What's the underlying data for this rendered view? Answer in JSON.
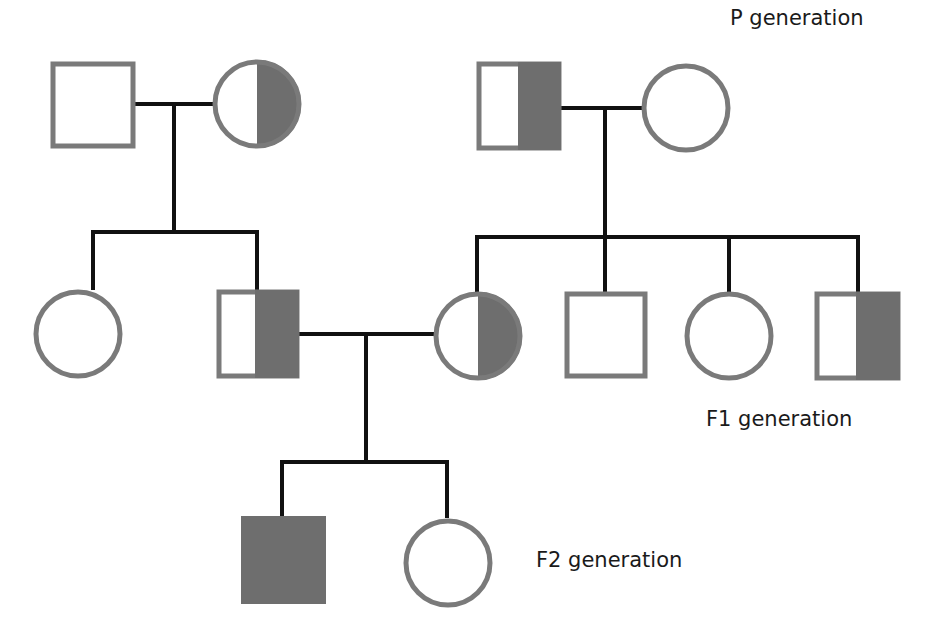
{
  "diagram": {
    "type": "pedigree",
    "colors": {
      "outline": "#7a7a7a",
      "fill": "#6e6e6e",
      "line": "#111111",
      "background": "#ffffff"
    },
    "labels": {
      "p": "P generation",
      "f1": "F1 generation",
      "f2": "F2 generation"
    },
    "individuals": [
      {
        "id": "P1",
        "generation": "P",
        "sex": "male",
        "status": "unaffected"
      },
      {
        "id": "P2",
        "generation": "P",
        "sex": "female",
        "status": "carrier"
      },
      {
        "id": "P3",
        "generation": "P",
        "sex": "male",
        "status": "carrier"
      },
      {
        "id": "P4",
        "generation": "P",
        "sex": "female",
        "status": "unaffected"
      },
      {
        "id": "F1-1",
        "generation": "F1",
        "sex": "female",
        "status": "unaffected"
      },
      {
        "id": "F1-2",
        "generation": "F1",
        "sex": "male",
        "status": "carrier"
      },
      {
        "id": "F1-3",
        "generation": "F1",
        "sex": "female",
        "status": "carrier"
      },
      {
        "id": "F1-4",
        "generation": "F1",
        "sex": "male",
        "status": "unaffected"
      },
      {
        "id": "F1-5",
        "generation": "F1",
        "sex": "female",
        "status": "unaffected"
      },
      {
        "id": "F1-6",
        "generation": "F1",
        "sex": "male",
        "status": "carrier"
      },
      {
        "id": "F2-1",
        "generation": "F2",
        "sex": "male",
        "status": "affected"
      },
      {
        "id": "F2-2",
        "generation": "F2",
        "sex": "female",
        "status": "unaffected"
      }
    ],
    "matings": [
      {
        "parents": [
          "P1",
          "P2"
        ],
        "children": [
          "F1-1",
          "F1-2"
        ]
      },
      {
        "parents": [
          "P3",
          "P4"
        ],
        "children": [
          "F1-3",
          "F1-4",
          "F1-5",
          "F1-6"
        ]
      },
      {
        "parents": [
          "F1-2",
          "F1-3"
        ],
        "children": [
          "F2-1",
          "F2-2"
        ]
      }
    ]
  }
}
